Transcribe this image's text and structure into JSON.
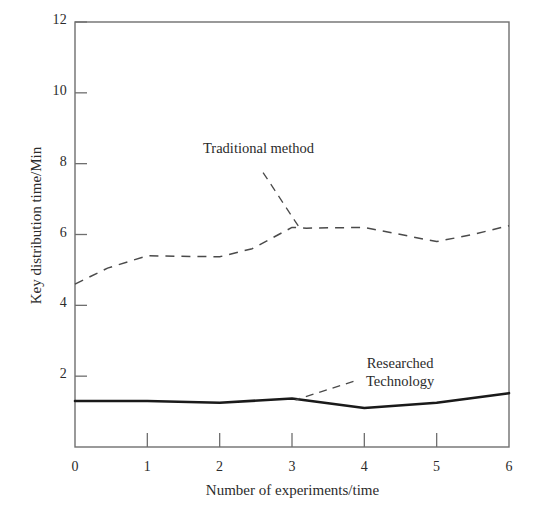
{
  "chart_data": {
    "type": "line",
    "title": "",
    "xlabel": "Number of experiments/time",
    "ylabel": "Key distribution time/Min",
    "xlim": [
      0,
      6
    ],
    "ylim": [
      0,
      12
    ],
    "xticks": [
      "0",
      "1",
      "2",
      "3",
      "4",
      "5",
      "6"
    ],
    "yticks": [
      "2",
      "4",
      "6",
      "8",
      "10",
      "12"
    ],
    "grid": false,
    "legend_position": "inline-annotations",
    "x": [
      0,
      1,
      2,
      3,
      4,
      5,
      6
    ],
    "series": [
      {
        "name": "Traditional method",
        "style": "dashed",
        "color": "#4a4a4a",
        "values": [
          4.6,
          5.4,
          5.4,
          6.2,
          6.2,
          5.8,
          6.25
        ],
        "detail_points": [
          {
            "x": 0.0,
            "y": 4.6
          },
          {
            "x": 0.45,
            "y": 5.05
          },
          {
            "x": 1.0,
            "y": 5.4
          },
          {
            "x": 2.0,
            "y": 5.37
          },
          {
            "x": 2.45,
            "y": 5.6
          },
          {
            "x": 3.0,
            "y": 6.2
          },
          {
            "x": 3.2,
            "y": 6.18
          },
          {
            "x": 4.0,
            "y": 6.2
          },
          {
            "x": 5.0,
            "y": 5.8
          },
          {
            "x": 5.5,
            "y": 6.0
          },
          {
            "x": 6.0,
            "y": 6.25
          }
        ]
      },
      {
        "name": "Researched Technology",
        "style": "solid",
        "color": "#1a1a1a",
        "values": [
          1.3,
          1.3,
          1.25,
          1.37,
          1.1,
          1.25,
          1.52
        ],
        "detail_points": [
          {
            "x": 0.0,
            "y": 1.3
          },
          {
            "x": 1.0,
            "y": 1.3
          },
          {
            "x": 2.0,
            "y": 1.25
          },
          {
            "x": 3.0,
            "y": 1.37
          },
          {
            "x": 4.0,
            "y": 1.1
          },
          {
            "x": 5.0,
            "y": 1.25
          },
          {
            "x": 6.0,
            "y": 1.52
          }
        ]
      }
    ],
    "annotations": [
      {
        "id": "traditional",
        "text": "Traditional method",
        "lines": [
          "Traditional method"
        ],
        "leader_from": {
          "x": 2.6,
          "y": 7.75
        },
        "leader_to": {
          "x": 3.1,
          "y": 6.2
        }
      },
      {
        "id": "researched",
        "text": "Researched Technology",
        "lines": [
          "Researched",
          "Technology"
        ],
        "leader_from": {
          "x": 3.85,
          "y": 1.85
        },
        "leader_to": {
          "x": 3.05,
          "y": 1.33
        }
      }
    ]
  },
  "axes": {
    "y_title": "Key distribution time/Min",
    "x_title": "Number of experiments/time",
    "y_tick_labels": [
      "12",
      "10",
      "8",
      "6",
      "4",
      "2"
    ],
    "x_tick_labels": [
      "0",
      "1",
      "2",
      "3",
      "4",
      "5",
      "6"
    ]
  },
  "annotations": {
    "traditional_label": "Traditional method",
    "researched_line1": "Researched",
    "researched_line2": "Technology"
  },
  "colors": {
    "frame": "#6f6f6f",
    "dashed_series": "#4a4a4a",
    "solid_series": "#1a1a1a",
    "text": "#2b2b2b",
    "background": "#ffffff"
  }
}
